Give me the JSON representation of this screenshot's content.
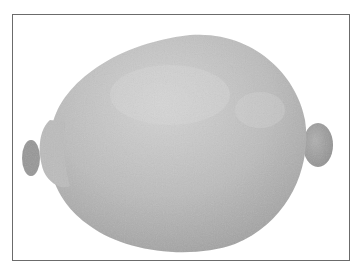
{
  "image": {
    "subject": "lemon",
    "style": "grayscale photograph",
    "colors": {
      "background": "#ffffff",
      "frame_border": "#6b6b6b",
      "fruit_light": "#d2d2d2",
      "fruit_mid": "#b4b4b4",
      "fruit_dark": "#9a9a9a"
    }
  }
}
